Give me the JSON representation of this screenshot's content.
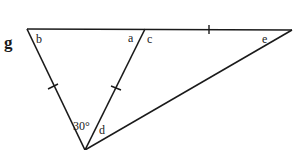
{
  "figure": {
    "part_label": "g",
    "angle_labels": {
      "b": "b",
      "a": "a",
      "c": "c",
      "e": "e",
      "d": "d",
      "given": "30°"
    },
    "line_color": "#1a1a1a"
  }
}
